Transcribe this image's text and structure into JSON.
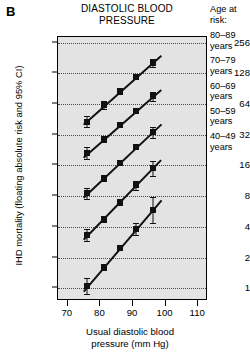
{
  "panel": {
    "label": "B"
  },
  "header": {
    "title_line1": "DIASTOLIC BLOOD",
    "title_line2": "PRESSURE"
  },
  "legend": {
    "title_line1": "Age at",
    "title_line2": "risk:",
    "items": [
      {
        "range": "80–89",
        "unit": "years"
      },
      {
        "range": "70–79",
        "unit": "years"
      },
      {
        "range": "60–69",
        "unit": "years"
      },
      {
        "range": "50–59",
        "unit": "years"
      },
      {
        "range": "40–49",
        "unit": "years"
      }
    ]
  },
  "axes": {
    "ylabel": "IHD mortality (floating absolute risk and 95% CI)",
    "xlabel_line1": "Usual diastolic blood",
    "xlabel_line2": "pressure (mm Hg)"
  },
  "chart_data": {
    "type": "scatter",
    "title": "DIASTOLIC BLOOD PRESSURE",
    "xlabel": "Usual diastolic blood pressure (mm Hg)",
    "ylabel": "IHD mortality (floating absolute risk and 95% CI)",
    "yscale": "log2",
    "ylim": [
      0.75,
      290
    ],
    "xlim": [
      67,
      113
    ],
    "ytick_labels": [
      "1",
      "2",
      "4",
      "8",
      "16",
      "32",
      "64",
      "128",
      "256"
    ],
    "ytick_values": [
      1,
      2,
      4,
      8,
      16,
      32,
      64,
      128,
      256
    ],
    "xtick_labels": [
      "70",
      "80",
      "90",
      "100",
      "110"
    ],
    "xtick_values": [
      70,
      80,
      90,
      100,
      110
    ],
    "grid": "horizontal-dotted",
    "legend_position": "right-outside",
    "marker": "filled-square",
    "series": [
      {
        "name": "80–89 years",
        "x": [
          76,
          81,
          86,
          91,
          96
        ],
        "y": [
          43,
          62,
          85,
          118,
          160
        ],
        "yerr_low": [
          38,
          57,
          80,
          112,
          146
        ],
        "yerr_high": [
          49,
          68,
          91,
          124,
          176
        ]
      },
      {
        "name": "70–79 years",
        "x": [
          76,
          81,
          86,
          91,
          96
        ],
        "y": [
          21,
          29,
          40,
          55,
          76
        ],
        "yerr_low": [
          18.5,
          27,
          38,
          52,
          69
        ],
        "yerr_high": [
          24,
          31,
          42,
          58,
          84
        ]
      },
      {
        "name": "60–69 years",
        "x": [
          76,
          81,
          86,
          91,
          96
        ],
        "y": [
          8.5,
          12,
          17,
          24,
          34
        ],
        "yerr_low": [
          7.5,
          11.3,
          16.2,
          22.8,
          30
        ],
        "yerr_high": [
          9.7,
          12.8,
          17.9,
          25.3,
          38
        ]
      },
      {
        "name": "50–59 years",
        "x": [
          76,
          81,
          86,
          91,
          96
        ],
        "y": [
          3.3,
          4.8,
          7.0,
          10.2,
          15.0
        ],
        "yerr_low": [
          2.9,
          4.5,
          6.6,
          9.2,
          12.6
        ],
        "yerr_high": [
          3.8,
          5.1,
          7.4,
          11.3,
          17.8
        ]
      },
      {
        "name": "40–49 years",
        "x": [
          76,
          81,
          86,
          91,
          96
        ],
        "y": [
          1.05,
          1.6,
          2.5,
          3.8,
          5.9
        ],
        "yerr_low": [
          0.88,
          1.5,
          2.35,
          3.3,
          4.4
        ],
        "yerr_high": [
          1.25,
          1.72,
          2.66,
          4.4,
          7.9
        ]
      }
    ]
  }
}
